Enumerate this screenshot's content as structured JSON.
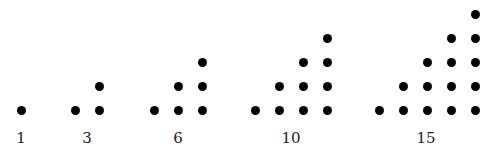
{
  "spacing_px": 24,
  "baseline_y": 110,
  "dot_color": "#000000",
  "figures": [
    {
      "label": "1",
      "n": 1,
      "start_x": 21,
      "label_x": 21
    },
    {
      "label": "3",
      "n": 2,
      "start_x": 75,
      "label_x": 87
    },
    {
      "label": "6",
      "n": 3,
      "start_x": 154,
      "label_x": 178
    },
    {
      "label": "10",
      "n": 4,
      "start_x": 255,
      "label_x": 291
    },
    {
      "label": "15",
      "n": 5,
      "start_x": 379,
      "label_x": 426
    }
  ]
}
